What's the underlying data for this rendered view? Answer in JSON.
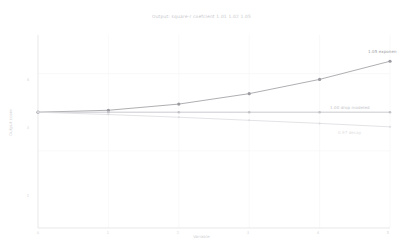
{
  "chart_data": {
    "type": "line",
    "title": "Output: square-r coefcient 1.01 1.02 1.05",
    "xlabel": "Variable",
    "ylabel": "Output score",
    "xlim": [
      0,
      5
    ],
    "ylim": [
      0,
      5
    ],
    "x": [
      0,
      1,
      2,
      3,
      4,
      5
    ],
    "xticks": [
      "0",
      "1",
      "2",
      "3",
      "4",
      "5"
    ],
    "yticks": [
      "4",
      "3",
      "2"
    ],
    "ytick_values": [
      4,
      3,
      2
    ],
    "grid": true,
    "legend_position": "inline-right",
    "series": [
      {
        "name": "1.05 exponen",
        "label": "1.05 exponen",
        "color": "#9a9aa0",
        "values": [
          3.0,
          3.05,
          3.21,
          3.48,
          3.85,
          4.32
        ],
        "marker": "circle",
        "annotation": "1.05 exponen"
      },
      {
        "name": "1.00 drop modeled",
        "label": "1.00 drop modeled",
        "color": "#c2c2c7",
        "values": [
          3.0,
          3.0,
          3.0,
          3.0,
          3.0,
          3.0
        ],
        "marker": "circle",
        "annotation": "1.00 drop modeled"
      },
      {
        "name": "0.97 decay",
        "label": "0.97 decay",
        "color": "#dcdce0",
        "values": [
          3.0,
          2.94,
          2.87,
          2.79,
          2.71,
          2.62
        ],
        "marker": "circle",
        "annotation": "0.97 decay"
      }
    ]
  },
  "colors": {
    "axis": "#d8d8dc",
    "grid": "#f2f2f4",
    "background": "#ffffff",
    "title": "#c8c8cc"
  }
}
